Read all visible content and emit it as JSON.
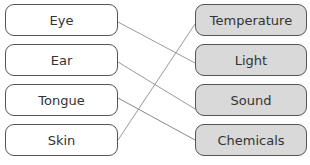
{
  "diagram": {
    "left_items": [
      {
        "label": "Eye"
      },
      {
        "label": "Ear"
      },
      {
        "label": "Tongue"
      },
      {
        "label": "Skin"
      }
    ],
    "right_items": [
      {
        "label": "Temperature"
      },
      {
        "label": "Light"
      },
      {
        "label": "Sound"
      },
      {
        "label": "Chemicals"
      }
    ],
    "connections": [
      {
        "from": "Eye",
        "to": "Light"
      },
      {
        "from": "Ear",
        "to": "Sound"
      },
      {
        "from": "Tongue",
        "to": "Chemicals"
      },
      {
        "from": "Skin",
        "to": "Temperature"
      }
    ],
    "colors": {
      "left_fill": "#ffffff",
      "right_fill": "#d9d9d9",
      "border": "#555555",
      "line": "#999999"
    }
  }
}
